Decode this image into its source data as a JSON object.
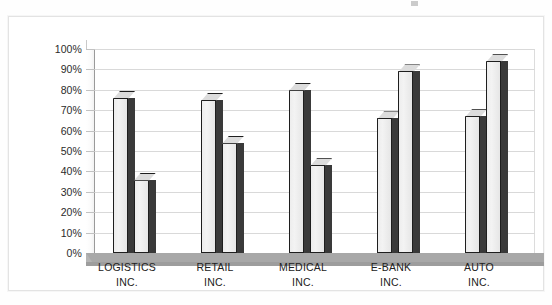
{
  "chart_data": {
    "type": "bar",
    "title": "",
    "subtitle": "",
    "xlabel": "",
    "ylabel": "",
    "ylim": [
      0,
      100
    ],
    "y_unit": "%",
    "grid": true,
    "legend": "none",
    "style": "3d-column-grayscale",
    "categories": [
      "LOGISTICS INC.",
      "RETAIL INC.",
      "MEDICAL INC.",
      "E-BANK INC.",
      "AUTO INC."
    ],
    "category_lines": [
      [
        "LOGISTICS",
        "INC."
      ],
      [
        "RETAIL",
        "INC."
      ],
      [
        "MEDICAL",
        "INC."
      ],
      [
        "E-BANK",
        "INC."
      ],
      [
        "AUTO",
        "INC."
      ]
    ],
    "series": [
      {
        "name": "Series 1",
        "values": [
          76,
          75,
          80,
          66,
          67
        ]
      },
      {
        "name": "Series 2",
        "values": [
          36,
          54,
          43,
          89,
          94
        ]
      }
    ],
    "yticks": [
      0,
      10,
      20,
      30,
      40,
      50,
      60,
      70,
      80,
      90,
      100
    ],
    "ytick_labels": [
      "0%",
      "10%",
      "20%",
      "30%",
      "40%",
      "50%",
      "60%",
      "70%",
      "80%",
      "90%",
      "100%"
    ]
  },
  "colors": {
    "bar_front": "#ededed",
    "bar_side": "#383838",
    "bar_outline": "#1e1e1e",
    "gridline": "#d9d9d9",
    "floor": "#b4b4b4",
    "axis": "#9a9a9a",
    "frame": "#e3e3e3",
    "text": "#222222",
    "background": "#ffffff"
  }
}
